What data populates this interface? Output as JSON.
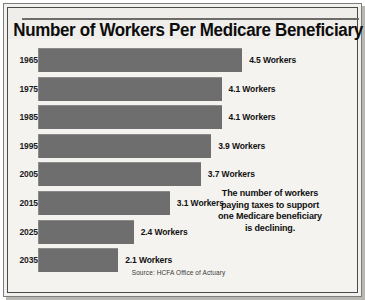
{
  "chart_data": {
    "type": "bar",
    "orientation": "horizontal",
    "title": "Number of Workers Per Medicare Beneficiary",
    "xlabel": "",
    "ylabel": "",
    "grid": false,
    "legend": null,
    "categories": [
      "1965",
      "1975",
      "1985",
      "1995",
      "2005",
      "2015",
      "2025",
      "2035"
    ],
    "values": [
      4.5,
      4.1,
      4.1,
      3.9,
      3.7,
      3.1,
      2.4,
      2.1
    ],
    "value_labels": [
      "4.5 Workers",
      "4.1 Workers",
      "4.1 Workers",
      "3.9 Workers",
      "3.7 Workers",
      "3.1 Workers",
      "2.4 Workers",
      "2.1 Workers"
    ],
    "unit": "Workers",
    "xlim": [
      0,
      4.9
    ],
    "annotation": [
      "The number of workers",
      "paying taxes to support",
      "one Medicare beneficiary",
      "is declining."
    ],
    "source": "Source: HCFA Office of Actuary",
    "colors": {
      "bar": "#6e6e6e",
      "background": "#f4f3f0",
      "text": "#111111",
      "frame": "#4a4a4a"
    }
  }
}
